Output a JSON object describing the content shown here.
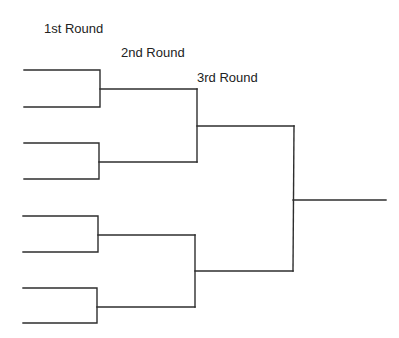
{
  "diagram": {
    "type": "tournament-bracket",
    "rounds": [
      {
        "label": "1st Round",
        "slots": 8
      },
      {
        "label": "2nd Round",
        "slots": 4
      },
      {
        "label": "3rd Round",
        "slots": 2
      }
    ],
    "final_slots": 1,
    "line_color": "#2e2e2e"
  }
}
